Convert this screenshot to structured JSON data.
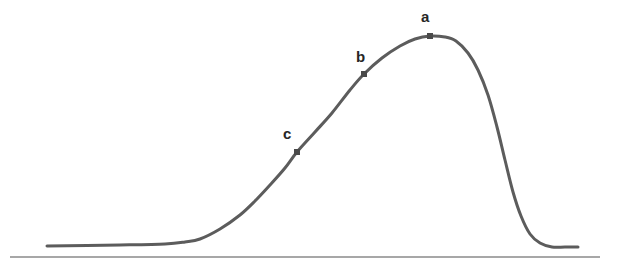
{
  "figure": {
    "title": "",
    "background_color": "#ffffff",
    "width": 623,
    "height": 276
  },
  "labels": {
    "a": "a",
    "b": "b",
    "c": "c"
  },
  "chart_data": {
    "type": "line",
    "title": "",
    "xlabel": "",
    "ylabel": "",
    "grid": false,
    "legend": null,
    "axis": {
      "baseline_y": 257,
      "baseline_x_start": 10,
      "baseline_x_end": 600,
      "color": "#8a8a8a",
      "width": 1.5
    },
    "curve": {
      "name": "skewed bell curve",
      "color": "#5c5c5c",
      "stroke_width": 3,
      "points": [
        [
          47,
          246
        ],
        [
          120,
          245
        ],
        [
          165,
          244
        ],
        [
          185,
          242
        ],
        [
          200,
          239
        ],
        [
          220,
          229
        ],
        [
          240,
          215
        ],
        [
          255,
          201
        ],
        [
          270,
          185
        ],
        [
          285,
          168
        ],
        [
          297,
          152
        ],
        [
          315,
          132
        ],
        [
          332,
          113
        ],
        [
          350,
          90
        ],
        [
          364,
          74
        ],
        [
          382,
          58
        ],
        [
          400,
          46
        ],
        [
          415,
          39
        ],
        [
          430,
          36
        ],
        [
          445,
          37
        ],
        [
          456,
          41
        ],
        [
          468,
          53
        ],
        [
          478,
          70
        ],
        [
          488,
          95
        ],
        [
          497,
          127
        ],
        [
          505,
          160
        ],
        [
          513,
          192
        ],
        [
          521,
          216
        ],
        [
          530,
          234
        ],
        [
          540,
          243
        ],
        [
          552,
          247
        ],
        [
          565,
          247
        ],
        [
          578,
          247
        ]
      ]
    },
    "markers": [
      {
        "id": "a",
        "label": "a",
        "x": 430,
        "y": 36,
        "size": 6,
        "color": "#4a4a4a",
        "shape": "square",
        "label_offset_x": -9,
        "label_offset_y": -27,
        "note": "peak of curve"
      },
      {
        "id": "b",
        "label": "b",
        "x": 364,
        "y": 74,
        "size": 6,
        "color": "#4a4a4a",
        "shape": "square",
        "label_offset_x": -8,
        "label_offset_y": -25,
        "note": "on rising flank"
      },
      {
        "id": "c",
        "label": "c",
        "x": 297,
        "y": 152,
        "size": 6,
        "color": "#4a4a4a",
        "shape": "square",
        "label_offset_x": -14,
        "label_offset_y": -26,
        "note": "lower on rising flank"
      }
    ],
    "xlim": [
      0,
      623
    ],
    "ylim": [
      276,
      0
    ]
  }
}
